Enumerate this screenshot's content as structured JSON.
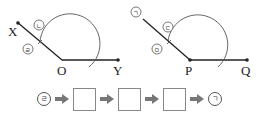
{
  "diagram_left": {
    "vertex_label": "O",
    "ray1_label": "X",
    "ray2_label": "Y",
    "marks": [
      {
        "id": "nieun",
        "label": "ㄴ"
      },
      {
        "id": "rieul",
        "label": "ㄹ"
      }
    ]
  },
  "diagram_right": {
    "vertex_label": "P",
    "ray2_label": "Q",
    "marks": [
      {
        "id": "giyeok",
        "label": "ㄱ"
      },
      {
        "id": "digeut",
        "label": "ㄷ"
      },
      {
        "id": "mieum",
        "label": "ㅁ"
      }
    ]
  },
  "sequence": {
    "start": "ㄹ",
    "blanks": [
      "",
      "",
      ""
    ],
    "end": "ㄱ",
    "arrow_icon": "right-arrow-icon"
  }
}
